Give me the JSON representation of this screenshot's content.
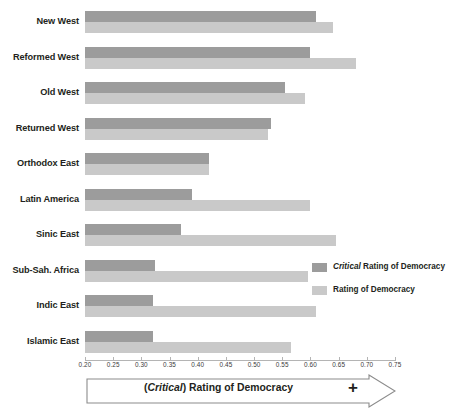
{
  "chart_data": {
    "type": "bar",
    "orientation": "horizontal",
    "title": "",
    "xlabel": "(Critical) Rating of Democracy",
    "ylabel": "",
    "xlim": [
      0.2,
      0.75
    ],
    "xticks": [
      "0.20",
      "0.25",
      "0.30",
      "0.35",
      "0.40",
      "0.45",
      "0.50",
      "0.55",
      "0.60",
      "0.65",
      "0.70",
      "0.75"
    ],
    "xtick_values": [
      0.2,
      0.25,
      0.3,
      0.35,
      0.4,
      0.45,
      0.5,
      0.55,
      0.6,
      0.65,
      0.7,
      0.75
    ],
    "grid": false,
    "legend_position": "right-middle",
    "categories": [
      "New West",
      "Reformed West",
      "Old West",
      "Returned West",
      "Orthodox East",
      "Latin America",
      "Sinic East",
      "Sub-Sah. Africa",
      "Indic East",
      "Islamic East"
    ],
    "series": [
      {
        "name": "Critical Rating of Democracy",
        "color": "#9c9c9c",
        "values": [
          0.61,
          0.6,
          0.555,
          0.53,
          0.42,
          0.39,
          0.37,
          0.325,
          0.32,
          0.32
        ]
      },
      {
        "name": "Rating of Democracy",
        "color": "#c9c9c9",
        "values": [
          0.64,
          0.68,
          0.59,
          0.525,
          0.42,
          0.6,
          0.645,
          0.595,
          0.61,
          0.565
        ]
      }
    ]
  },
  "legend": {
    "items": [
      {
        "emphasis": "Critical",
        "label": " Rating of Democracy",
        "swatch": "critical"
      },
      {
        "emphasis": "",
        "label": "Rating of Democracy",
        "swatch": "rating"
      }
    ]
  },
  "axis_banner": {
    "emphasis": "Critical",
    "prefix": "(",
    "suffix": ") Rating of Democracy",
    "plus": "+"
  },
  "colors": {
    "critical_bar": "#9c9c9c",
    "rating_bar": "#c9c9c9",
    "axis": "#b4b4b4",
    "text": "#231f20",
    "banner_outline": "#8c8c8c"
  }
}
